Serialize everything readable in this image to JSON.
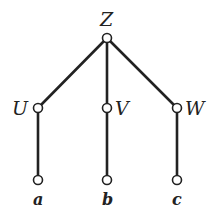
{
  "diagram": {
    "type": "tree",
    "nodes": [
      {
        "id": "Z",
        "label": "Z",
        "x": 107,
        "y": 38
      },
      {
        "id": "U",
        "label": "U",
        "x": 38,
        "y": 108
      },
      {
        "id": "V",
        "label": "V",
        "x": 107,
        "y": 108
      },
      {
        "id": "W",
        "label": "W",
        "x": 177,
        "y": 108
      },
      {
        "id": "a",
        "label": "a",
        "x": 38,
        "y": 180
      },
      {
        "id": "b",
        "label": "b",
        "x": 107,
        "y": 180
      },
      {
        "id": "c",
        "label": "c",
        "x": 177,
        "y": 180
      }
    ],
    "edges": [
      [
        "Z",
        "U"
      ],
      [
        "Z",
        "V"
      ],
      [
        "Z",
        "W"
      ],
      [
        "U",
        "a"
      ],
      [
        "V",
        "b"
      ],
      [
        "W",
        "c"
      ]
    ],
    "colors": {
      "line": "#222222",
      "node_fill": "#ffffff"
    }
  }
}
